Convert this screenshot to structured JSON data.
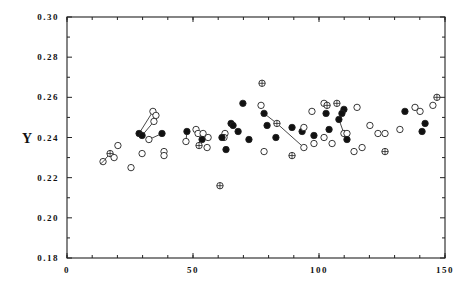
{
  "chart_data": {
    "type": "scatter",
    "title": "",
    "xlabel": "",
    "ylabel": "Y",
    "xlim": [
      0,
      150
    ],
    "ylim": [
      0.18,
      0.3
    ],
    "grid": false,
    "legend": null,
    "x_ticks": [
      "0",
      "50",
      "100",
      "150"
    ],
    "y_ticks": [
      "0.18",
      "0.20",
      "0.22",
      "0.24",
      "0.26",
      "0.28",
      "0.30"
    ],
    "marker_types": {
      "open": "open circle",
      "filled": "filled circle",
      "cross": "circle with cross",
      "slash": "circle with slash"
    },
    "points": [
      {
        "x": 14.3,
        "y": 0.228,
        "m": "slash"
      },
      {
        "x": 17.1,
        "y": 0.232,
        "m": "cross"
      },
      {
        "x": 18.7,
        "y": 0.23,
        "m": "open"
      },
      {
        "x": 20.2,
        "y": 0.236,
        "m": "open"
      },
      {
        "x": 25.4,
        "y": 0.225,
        "m": "open"
      },
      {
        "x": 29.8,
        "y": 0.232,
        "m": "open"
      },
      {
        "x": 28.6,
        "y": 0.242,
        "m": "filled"
      },
      {
        "x": 29.8,
        "y": 0.241,
        "m": "filled"
      },
      {
        "x": 34.1,
        "y": 0.253,
        "m": "open"
      },
      {
        "x": 35.3,
        "y": 0.251,
        "m": "open"
      },
      {
        "x": 34.5,
        "y": 0.248,
        "m": "open"
      },
      {
        "x": 32.5,
        "y": 0.239,
        "m": "open"
      },
      {
        "x": 37.7,
        "y": 0.242,
        "m": "filled"
      },
      {
        "x": 38.5,
        "y": 0.233,
        "m": "open"
      },
      {
        "x": 38.5,
        "y": 0.231,
        "m": "open"
      },
      {
        "x": 47.6,
        "y": 0.243,
        "m": "filled"
      },
      {
        "x": 47.2,
        "y": 0.238,
        "m": "open"
      },
      {
        "x": 51.2,
        "y": 0.244,
        "m": "open"
      },
      {
        "x": 52.0,
        "y": 0.242,
        "m": "open"
      },
      {
        "x": 54.0,
        "y": 0.242,
        "m": "open"
      },
      {
        "x": 53.6,
        "y": 0.239,
        "m": "filled"
      },
      {
        "x": 56.0,
        "y": 0.24,
        "m": "open"
      },
      {
        "x": 52.4,
        "y": 0.236,
        "m": "cross"
      },
      {
        "x": 55.6,
        "y": 0.235,
        "m": "open"
      },
      {
        "x": 60.7,
        "y": 0.216,
        "m": "cross"
      },
      {
        "x": 62.7,
        "y": 0.242,
        "m": "open"
      },
      {
        "x": 62.3,
        "y": 0.24,
        "m": "open"
      },
      {
        "x": 61.5,
        "y": 0.24,
        "m": "filled"
      },
      {
        "x": 63.1,
        "y": 0.234,
        "m": "filled"
      },
      {
        "x": 65.1,
        "y": 0.247,
        "m": "filled"
      },
      {
        "x": 65.9,
        "y": 0.246,
        "m": "filled"
      },
      {
        "x": 67.9,
        "y": 0.243,
        "m": "filled"
      },
      {
        "x": 69.8,
        "y": 0.257,
        "m": "filled"
      },
      {
        "x": 72.2,
        "y": 0.239,
        "m": "filled"
      },
      {
        "x": 77.0,
        "y": 0.256,
        "m": "open"
      },
      {
        "x": 77.4,
        "y": 0.267,
        "m": "cross"
      },
      {
        "x": 78.2,
        "y": 0.252,
        "m": "filled"
      },
      {
        "x": 79.4,
        "y": 0.246,
        "m": "filled"
      },
      {
        "x": 78.2,
        "y": 0.233,
        "m": "open"
      },
      {
        "x": 83.3,
        "y": 0.247,
        "m": "cross"
      },
      {
        "x": 82.9,
        "y": 0.24,
        "m": "filled"
      },
      {
        "x": 89.3,
        "y": 0.245,
        "m": "filled"
      },
      {
        "x": 89.3,
        "y": 0.231,
        "m": "cross"
      },
      {
        "x": 93.3,
        "y": 0.243,
        "m": "filled"
      },
      {
        "x": 94.0,
        "y": 0.245,
        "m": "open"
      },
      {
        "x": 94.0,
        "y": 0.235,
        "m": "open"
      },
      {
        "x": 97.2,
        "y": 0.253,
        "m": "open"
      },
      {
        "x": 98.0,
        "y": 0.241,
        "m": "filled"
      },
      {
        "x": 98.0,
        "y": 0.237,
        "m": "open"
      },
      {
        "x": 102.0,
        "y": 0.257,
        "m": "open"
      },
      {
        "x": 103.2,
        "y": 0.256,
        "m": "cross"
      },
      {
        "x": 102.8,
        "y": 0.252,
        "m": "filled"
      },
      {
        "x": 104.0,
        "y": 0.244,
        "m": "filled"
      },
      {
        "x": 102.0,
        "y": 0.24,
        "m": "open"
      },
      {
        "x": 105.2,
        "y": 0.237,
        "m": "open"
      },
      {
        "x": 107.1,
        "y": 0.257,
        "m": "cross"
      },
      {
        "x": 109.9,
        "y": 0.254,
        "m": "filled"
      },
      {
        "x": 109.1,
        "y": 0.252,
        "m": "filled"
      },
      {
        "x": 107.9,
        "y": 0.249,
        "m": "filled"
      },
      {
        "x": 109.9,
        "y": 0.242,
        "m": "open"
      },
      {
        "x": 111.1,
        "y": 0.242,
        "m": "open"
      },
      {
        "x": 111.1,
        "y": 0.239,
        "m": "filled"
      },
      {
        "x": 115.1,
        "y": 0.255,
        "m": "open"
      },
      {
        "x": 113.9,
        "y": 0.233,
        "m": "open"
      },
      {
        "x": 117.1,
        "y": 0.235,
        "m": "open"
      },
      {
        "x": 120.2,
        "y": 0.246,
        "m": "open"
      },
      {
        "x": 123.4,
        "y": 0.242,
        "m": "open"
      },
      {
        "x": 126.2,
        "y": 0.242,
        "m": "open"
      },
      {
        "x": 126.2,
        "y": 0.233,
        "m": "cross"
      },
      {
        "x": 132.1,
        "y": 0.244,
        "m": "open"
      },
      {
        "x": 134.1,
        "y": 0.253,
        "m": "filled"
      },
      {
        "x": 138.1,
        "y": 0.255,
        "m": "open"
      },
      {
        "x": 140.1,
        "y": 0.253,
        "m": "open"
      },
      {
        "x": 142.1,
        "y": 0.247,
        "m": "filled"
      },
      {
        "x": 140.9,
        "y": 0.243,
        "m": "filled"
      },
      {
        "x": 145.2,
        "y": 0.256,
        "m": "open"
      },
      {
        "x": 146.8,
        "y": 0.26,
        "m": "cross"
      }
    ],
    "connecting_lines": [
      [
        0,
        1
      ],
      [
        6,
        8
      ],
      [
        7,
        10
      ],
      [
        12,
        11
      ],
      [
        15,
        16
      ],
      [
        36,
        39,
        45
      ],
      [
        56,
        57,
        58,
        59,
        61
      ]
    ]
  }
}
